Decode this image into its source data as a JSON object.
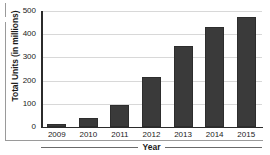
{
  "chart_data": {
    "type": "bar",
    "title": "",
    "xlabel": "Year",
    "ylabel": "Total Units (in millions)",
    "categories": [
      "2009",
      "2010",
      "2011",
      "2012",
      "2013",
      "2014",
      "2015"
    ],
    "values": [
      15,
      40,
      95,
      215,
      348,
      430,
      475
    ],
    "series": [
      {
        "name": "Total Units",
        "values": [
          15,
          40,
          95,
          215,
          348,
          430,
          475
        ]
      }
    ],
    "ylim": [
      0,
      500
    ],
    "yticks": [
      0,
      100,
      200,
      300,
      400,
      500
    ],
    "ytick_labels": [
      "0",
      "100",
      "200",
      "300",
      "400",
      "500"
    ],
    "grid": "horizontal",
    "legend": "none",
    "bar_color": "#3a3a3a",
    "gridline_color": "#d8d8d8",
    "axis_color": "#2b2b2b",
    "background": "#ffffff"
  }
}
